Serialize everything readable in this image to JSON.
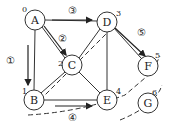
{
  "diagram": {
    "nodes": [
      {
        "id": "A",
        "label": "A",
        "order": "0",
        "x": 35,
        "y": 20
      },
      {
        "id": "B",
        "label": "B",
        "order": "1",
        "x": 34,
        "y": 100
      },
      {
        "id": "C",
        "label": "C",
        "order": "2",
        "x": 72,
        "y": 65
      },
      {
        "id": "D",
        "label": "D",
        "order": "3",
        "x": 107,
        "y": 22
      },
      {
        "id": "E",
        "label": "E",
        "order": "4",
        "x": 107,
        "y": 100
      },
      {
        "id": "F",
        "label": "F",
        "order": "5",
        "x": 148,
        "y": 66
      },
      {
        "id": "G",
        "label": "G",
        "order": "6",
        "x": 148,
        "y": 103
      }
    ],
    "edges": [
      [
        "A",
        "B"
      ],
      [
        "A",
        "C"
      ],
      [
        "A",
        "D"
      ],
      [
        "B",
        "C"
      ],
      [
        "B",
        "E"
      ],
      [
        "C",
        "D"
      ],
      [
        "C",
        "E"
      ],
      [
        "D",
        "E"
      ],
      [
        "D",
        "F"
      ]
    ],
    "step_labels": [
      {
        "label": "①",
        "x": 10,
        "y": 60
      },
      {
        "label": "②",
        "x": 64,
        "y": 38
      },
      {
        "label": "③",
        "x": 72,
        "y": 14
      },
      {
        "label": "④",
        "x": 72,
        "y": 118
      },
      {
        "label": "⑤",
        "x": 141,
        "y": 32
      }
    ]
  }
}
